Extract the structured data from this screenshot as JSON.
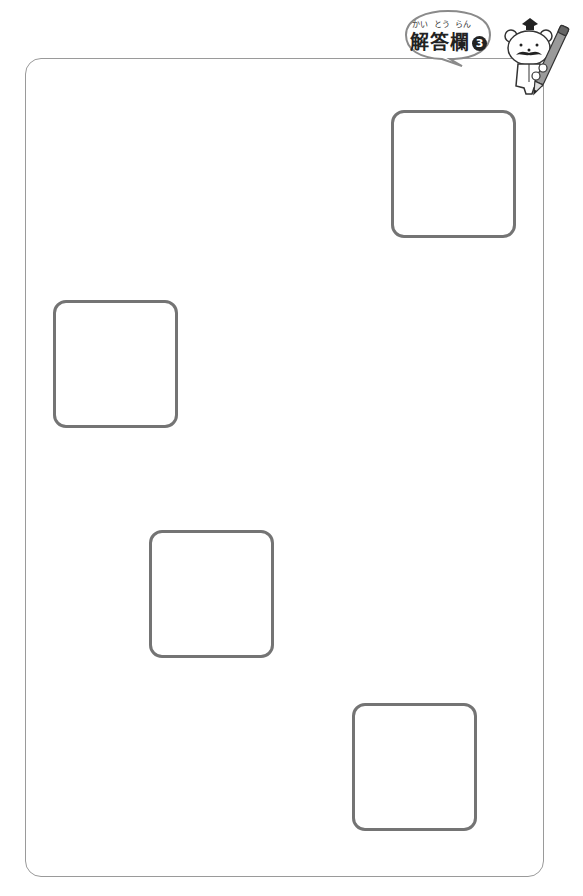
{
  "header": {
    "title": "解答欄",
    "title_ruby": [
      "かい",
      "とう",
      "らん"
    ],
    "section_number": "3",
    "mascot": "bear-with-pencil-icon"
  },
  "answer_sheet": {
    "boxes": [
      {
        "id": 1,
        "x": 391,
        "y": 110,
        "width": 125,
        "height": 128,
        "value": ""
      },
      {
        "id": 2,
        "x": 53,
        "y": 300,
        "width": 125,
        "height": 128,
        "value": ""
      },
      {
        "id": 3,
        "x": 149,
        "y": 530,
        "width": 125,
        "height": 128,
        "value": ""
      },
      {
        "id": 4,
        "x": 352,
        "y": 703,
        "width": 125,
        "height": 128,
        "value": ""
      }
    ]
  },
  "colors": {
    "frame_border": "#9a9a9a",
    "box_border": "#747474",
    "text": "#222222"
  }
}
